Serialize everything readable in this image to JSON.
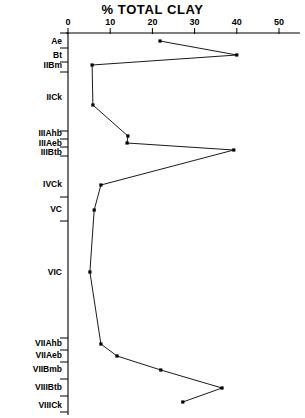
{
  "chart_data": {
    "type": "line",
    "title": "% TOTAL CLAY",
    "xlabel": "% TOTAL CLAY",
    "ylabel": "",
    "orientation": "horizontal-profile",
    "xlim": [
      0,
      55
    ],
    "ylim_note": "soil horizons top to bottom",
    "grid": false,
    "legend": "none",
    "xticks": [
      0,
      10,
      20,
      30,
      40,
      50
    ],
    "xtick_labels": [
      "0",
      "10",
      "20",
      "30",
      "40",
      "50"
    ],
    "categories": [
      "Ae",
      "Bt",
      "IIBm",
      "IICk",
      "IIIAhb",
      "IIIAeb",
      "IIIBtb",
      "IVCk",
      "VC",
      "VIC",
      "VIIAhb",
      "VIIAeb",
      "VIIBmb",
      "VIIIBtb",
      "VIIICk"
    ],
    "values": [
      21.8,
      40.0,
      5.7,
      5.9,
      14.2,
      14.0,
      39.3,
      7.8,
      6.2,
      5.2,
      7.8,
      11.6,
      22.0,
      36.5,
      27.2
    ],
    "depth_px": [
      41,
      55,
      65,
      105,
      136,
      143,
      150,
      185,
      210,
      272,
      344,
      356,
      370,
      388,
      402
    ],
    "tick_depths_px": [
      33,
      48,
      62,
      72,
      131,
      139,
      147,
      156,
      197,
      221,
      338,
      350,
      362,
      379,
      396,
      412
    ],
    "series": [
      {
        "name": "% total clay",
        "points": [
          {
            "horizon": "Ae",
            "value": 21.8
          },
          {
            "horizon": "Bt",
            "value": 40.0
          },
          {
            "horizon": "IIBm",
            "value": 5.7
          },
          {
            "horizon": "IICk",
            "value": 5.9
          },
          {
            "horizon": "IIIAhb",
            "value": 14.2
          },
          {
            "horizon": "IIIAeb",
            "value": 14.0
          },
          {
            "horizon": "IIIBtb",
            "value": 39.3
          },
          {
            "horizon": "IVCk",
            "value": 7.8
          },
          {
            "horizon": "VC",
            "value": 6.2
          },
          {
            "horizon": "VIC",
            "value": 5.2
          },
          {
            "horizon": "VIIAhb",
            "value": 7.8
          },
          {
            "horizon": "VIIAeb",
            "value": 11.6
          },
          {
            "horizon": "VIIBmb",
            "value": 22.0
          },
          {
            "horizon": "VIIIBtb",
            "value": 36.5
          },
          {
            "horizon": "VIIICk",
            "value": 27.2
          }
        ]
      }
    ]
  },
  "axis": {
    "x_origin_px": 68,
    "px_per_unit": 4.22,
    "axis_top_px": 33,
    "axis_bottom_px": 415
  },
  "colors": {
    "line": "#000000",
    "marker": "#000000",
    "axis": "#000000",
    "background": "#ffffff"
  }
}
